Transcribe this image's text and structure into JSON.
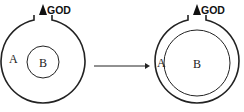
{
  "diagram": {
    "left": {
      "outer_label": "A",
      "inner_label": "B",
      "top_label": "GOD"
    },
    "right": {
      "outer_label": "A",
      "inner_label": "B",
      "top_label": "GOD"
    },
    "arrow": "transition-arrow"
  }
}
